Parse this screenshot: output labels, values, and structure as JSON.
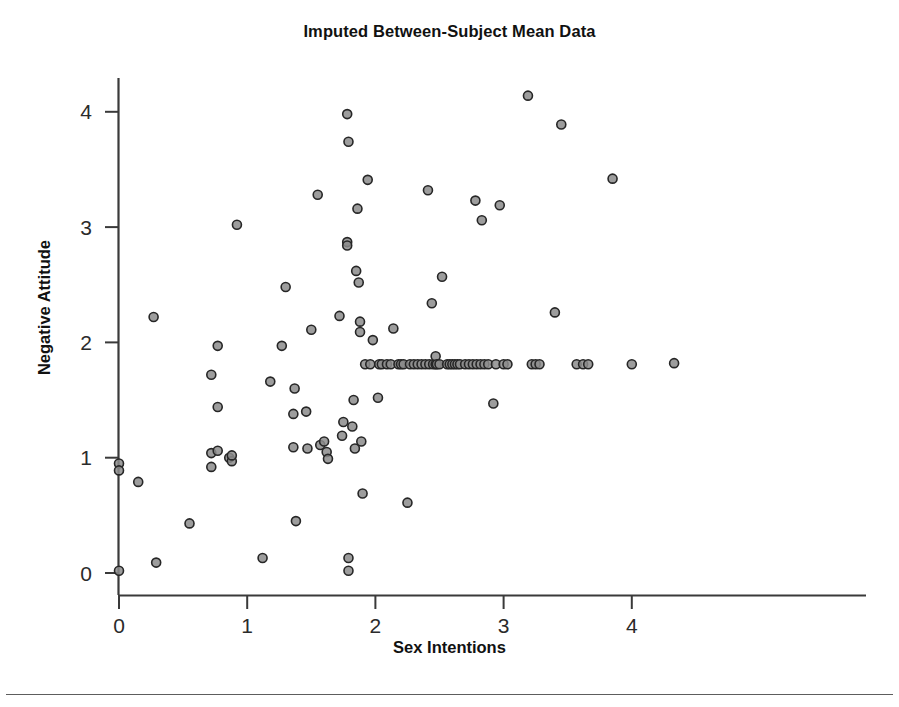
{
  "figure": {
    "title": "Imputed Between-Subject Mean Data",
    "xlabel": "Sex Intentions",
    "ylabel": "Negative Attitude"
  },
  "axes": {
    "x_ticks": [
      "0",
      "1",
      "2",
      "3",
      "4"
    ],
    "y_ticks": [
      "0",
      "1",
      "2",
      "3",
      "4"
    ]
  },
  "style": {
    "marker_fill": "#8c8c8c",
    "marker_stroke": "#262626",
    "axis_color": "#3a3a3a",
    "text_color": "#111111"
  },
  "chart_data": {
    "type": "scatter",
    "title": "Imputed Between-Subject Mean Data",
    "xlabel": "Sex Intentions",
    "ylabel": "Negative Attitude",
    "xlim": [
      -0.13,
      4.55
    ],
    "ylim": [
      -0.22,
      4.42
    ],
    "xticks": [
      0,
      1,
      2,
      3,
      4
    ],
    "yticks": [
      0,
      1,
      2,
      3,
      4
    ],
    "grid": false,
    "legend": false,
    "marker": {
      "shape": "circle",
      "fill": "#8c8c8c",
      "edge": "#262626",
      "size": 9
    },
    "n_points": 110,
    "points": [
      [
        0.0,
        0.95
      ],
      [
        0.0,
        0.89
      ],
      [
        0.0,
        0.02
      ],
      [
        0.15,
        0.79
      ],
      [
        0.27,
        2.22
      ],
      [
        0.29,
        0.09
      ],
      [
        0.55,
        0.43
      ],
      [
        0.72,
        1.72
      ],
      [
        0.72,
        1.04
      ],
      [
        0.72,
        0.92
      ],
      [
        0.77,
        1.97
      ],
      [
        0.77,
        1.44
      ],
      [
        0.77,
        1.06
      ],
      [
        0.86,
        1.0
      ],
      [
        0.88,
        0.97
      ],
      [
        0.88,
        1.02
      ],
      [
        0.92,
        3.02
      ],
      [
        1.12,
        0.13
      ],
      [
        1.18,
        1.66
      ],
      [
        1.27,
        1.97
      ],
      [
        1.3,
        2.48
      ],
      [
        1.36,
        1.38
      ],
      [
        1.36,
        1.09
      ],
      [
        1.37,
        1.6
      ],
      [
        1.38,
        0.45
      ],
      [
        1.46,
        1.4
      ],
      [
        1.47,
        1.08
      ],
      [
        1.5,
        2.11
      ],
      [
        1.55,
        3.28
      ],
      [
        1.57,
        1.11
      ],
      [
        1.6,
        1.14
      ],
      [
        1.62,
        1.05
      ],
      [
        1.63,
        0.99
      ],
      [
        1.72,
        2.23
      ],
      [
        1.74,
        1.19
      ],
      [
        1.75,
        1.31
      ],
      [
        1.78,
        3.98
      ],
      [
        1.78,
        2.87
      ],
      [
        1.78,
        2.84
      ],
      [
        1.79,
        3.74
      ],
      [
        1.79,
        0.13
      ],
      [
        1.79,
        0.02
      ],
      [
        1.82,
        1.27
      ],
      [
        1.83,
        1.5
      ],
      [
        1.84,
        1.08
      ],
      [
        1.85,
        2.62
      ],
      [
        1.86,
        3.16
      ],
      [
        1.87,
        2.52
      ],
      [
        1.88,
        2.18
      ],
      [
        1.88,
        2.09
      ],
      [
        1.89,
        1.14
      ],
      [
        1.9,
        0.69
      ],
      [
        1.92,
        1.81
      ],
      [
        1.94,
        3.41
      ],
      [
        1.96,
        1.81
      ],
      [
        1.98,
        2.02
      ],
      [
        2.02,
        1.52
      ],
      [
        2.03,
        1.81
      ],
      [
        2.05,
        1.81
      ],
      [
        2.09,
        1.81
      ],
      [
        2.12,
        1.81
      ],
      [
        2.14,
        2.12
      ],
      [
        2.18,
        1.81
      ],
      [
        2.2,
        1.81
      ],
      [
        2.22,
        1.81
      ],
      [
        2.25,
        0.61
      ],
      [
        2.27,
        1.81
      ],
      [
        2.3,
        1.81
      ],
      [
        2.33,
        1.81
      ],
      [
        2.36,
        1.81
      ],
      [
        2.39,
        1.81
      ],
      [
        2.41,
        3.32
      ],
      [
        2.42,
        1.81
      ],
      [
        2.44,
        2.34
      ],
      [
        2.45,
        1.81
      ],
      [
        2.47,
        1.81
      ],
      [
        2.47,
        1.88
      ],
      [
        2.48,
        1.81
      ],
      [
        2.5,
        1.81
      ],
      [
        2.52,
        2.57
      ],
      [
        2.56,
        1.81
      ],
      [
        2.58,
        1.81
      ],
      [
        2.6,
        1.81
      ],
      [
        2.62,
        1.81
      ],
      [
        2.64,
        1.81
      ],
      [
        2.66,
        1.81
      ],
      [
        2.7,
        1.81
      ],
      [
        2.73,
        1.81
      ],
      [
        2.76,
        1.81
      ],
      [
        2.78,
        3.23
      ],
      [
        2.79,
        1.81
      ],
      [
        2.82,
        1.81
      ],
      [
        2.83,
        3.06
      ],
      [
        2.85,
        1.81
      ],
      [
        2.88,
        1.81
      ],
      [
        2.92,
        1.47
      ],
      [
        2.94,
        1.81
      ],
      [
        2.97,
        3.19
      ],
      [
        3.0,
        1.81
      ],
      [
        3.03,
        1.81
      ],
      [
        3.19,
        4.14
      ],
      [
        3.22,
        1.81
      ],
      [
        3.25,
        1.81
      ],
      [
        3.28,
        1.81
      ],
      [
        3.4,
        2.26
      ],
      [
        3.45,
        3.89
      ],
      [
        3.57,
        1.81
      ],
      [
        3.62,
        1.81
      ],
      [
        3.66,
        1.81
      ],
      [
        3.85,
        3.42
      ],
      [
        4.0,
        1.81
      ],
      [
        4.33,
        1.82
      ]
    ]
  }
}
